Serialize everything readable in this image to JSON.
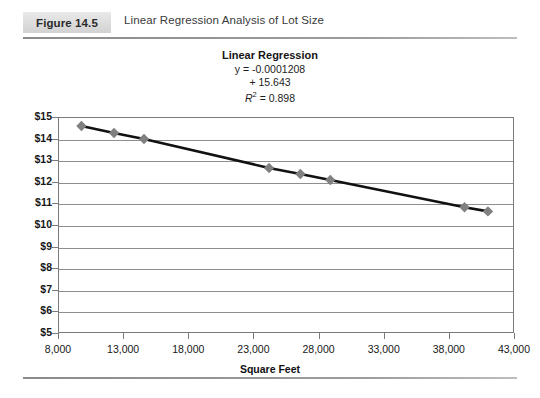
{
  "header": {
    "figure_label": "Figure 14.5",
    "title": "Linear Regression Analysis of Lot Size"
  },
  "regression": {
    "heading": "Linear Regression",
    "equation_line1": "y = -0.0001208",
    "equation_line2": "+ 15.643",
    "r_squared_prefix": "R",
    "r_squared_sup": "2",
    "r_squared_value": " = 0.898"
  },
  "colors": {
    "marker": "#808080",
    "line": "#111111",
    "grid": "#8e8e8e",
    "axis": "#7a7a7a",
    "badge_bg": "#dedede"
  },
  "chart_data": {
    "type": "line",
    "title": "Linear Regression",
    "xlabel": "Square Feet",
    "ylabel": "",
    "xlim": [
      8000,
      43000
    ],
    "ylim": [
      5,
      15
    ],
    "grid": true,
    "legend": "none",
    "xtick_labels": [
      "8,000",
      "13,000",
      "18,000",
      "23,000",
      "28,000",
      "33,000",
      "38,000",
      "43,000"
    ],
    "xtick_values": [
      8000,
      13000,
      18000,
      23000,
      28000,
      33000,
      38000,
      43000
    ],
    "ytick_labels": [
      "$15",
      "$14",
      "$13",
      "$12",
      "$11",
      "$10",
      "$9",
      "$8",
      "$7",
      "$6",
      "$5"
    ],
    "ytick_values": [
      15,
      14,
      13,
      12,
      11,
      10,
      9,
      8,
      7,
      6,
      5
    ],
    "x": [
      9800,
      12300,
      14600,
      24200,
      26600,
      28900,
      39200,
      41000
    ],
    "values": [
      14.58,
      14.26,
      13.98,
      12.64,
      12.36,
      12.08,
      10.82,
      10.63
    ],
    "annotations": [
      "y = -0.0001208",
      "+ 15.643",
      "R2 = 0.898"
    ]
  }
}
